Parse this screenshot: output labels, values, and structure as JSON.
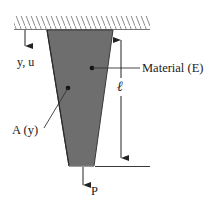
{
  "diagram": {
    "type": "tapered-bar-axial-load",
    "labels": {
      "axis": "y, u",
      "material": "Material (E)",
      "length": "ℓ",
      "area": "A (y)",
      "load": "P"
    },
    "colors": {
      "bar_fill": "#6e6e6e",
      "bar_edge": "#3a3a3a",
      "line": "#222222",
      "hatch": "#8a8a8a"
    }
  }
}
